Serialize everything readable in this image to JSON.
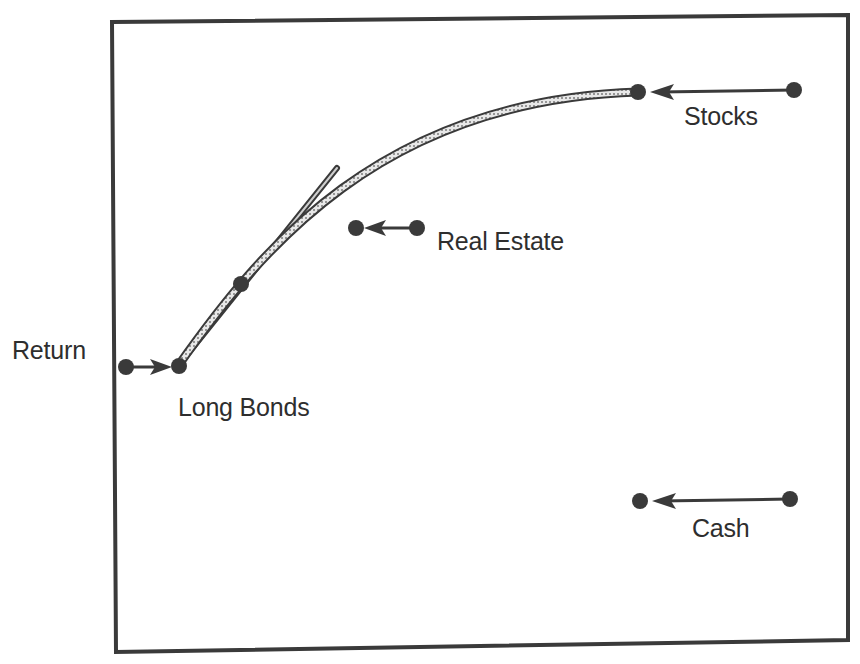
{
  "diagram": {
    "axis_label": "Return",
    "assets": [
      {
        "name": "Long Bonds",
        "label": "Long Bonds"
      },
      {
        "name": "Real Estate",
        "label": "Real Estate"
      },
      {
        "name": "Stocks",
        "label": "Stocks"
      },
      {
        "name": "Cash",
        "label": "Cash"
      }
    ],
    "colors": {
      "ink": "#2e2e2e",
      "dot": "#3a3a3a",
      "curve_fill": "#bdbdbd",
      "background": "#ffffff"
    }
  }
}
